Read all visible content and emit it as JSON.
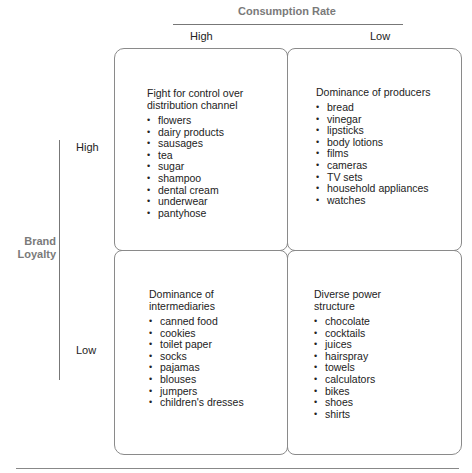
{
  "axes": {
    "x": {
      "title": "Consumption Rate",
      "labels": [
        "High",
        "Low"
      ]
    },
    "y": {
      "title": "Brand Loyalty",
      "labels": [
        "High",
        "Low"
      ]
    }
  },
  "quadrants": {
    "high_loyalty_high_consumption": {
      "title": "Fight for control over\ndistribution channel",
      "items": [
        "flowers",
        "dairy products",
        "sausages",
        "tea",
        "sugar",
        "shampoo",
        "dental cream",
        "underwear",
        "pantyhose"
      ]
    },
    "high_loyalty_low_consumption": {
      "title": "Dominance of producers",
      "items": [
        "bread",
        "vinegar",
        "lipsticks",
        "body lotions",
        "films",
        "cameras",
        "TV sets",
        "household appliances",
        "watches"
      ]
    },
    "low_loyalty_high_consumption": {
      "title": "Dominance of\nintermediaries",
      "items": [
        "canned food",
        "cookies",
        "toilet paper",
        "socks",
        "pajamas",
        "blouses",
        "jumpers",
        "children's dresses"
      ]
    },
    "low_loyalty_low_consumption": {
      "title": "Diverse power\nstructure",
      "items": [
        "chocolate",
        "cocktails",
        "juices",
        "hairspray",
        "towels",
        "calculators",
        "bikes",
        "shoes",
        "shirts"
      ]
    }
  },
  "colors": {
    "axis_title": "#7a7a7a",
    "border": "#8a8a8a",
    "text": "#222222"
  }
}
